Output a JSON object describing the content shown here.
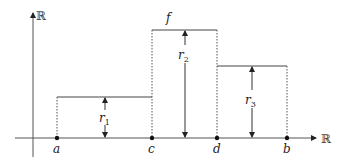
{
  "diagram": {
    "axes": {
      "x_label": "ℝ",
      "y_label": "ℝ"
    },
    "function_label": "f",
    "points": [
      {
        "name": "a",
        "label": "a"
      },
      {
        "name": "c",
        "label": "c"
      },
      {
        "name": "d",
        "label": "d"
      },
      {
        "name": "b",
        "label": "b"
      }
    ],
    "steps": [
      {
        "interval": [
          "a",
          "c"
        ],
        "height_label": "r",
        "height_sub": "1"
      },
      {
        "interval": [
          "c",
          "d"
        ],
        "height_label": "r",
        "height_sub": "2"
      },
      {
        "interval": [
          "d",
          "b"
        ],
        "height_label": "r",
        "height_sub": "3"
      }
    ],
    "colors": {
      "line": "#444444",
      "dotted": "#555555",
      "point": "#111111",
      "text": "#222222"
    }
  }
}
